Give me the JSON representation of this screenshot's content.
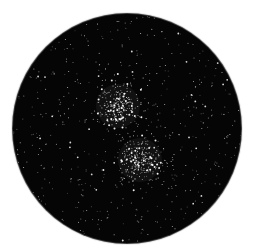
{
  "image": {
    "subject": "Circular telescope field of view showing a dense star field with two open star clusters (double cluster)",
    "background_color": "#ffffff",
    "field_color": "#050505",
    "star_color": "#ffffff",
    "clusters": [
      {
        "name": "upper-cluster",
        "position": "upper-center"
      },
      {
        "name": "lower-cluster",
        "position": "lower-center-right"
      }
    ]
  }
}
